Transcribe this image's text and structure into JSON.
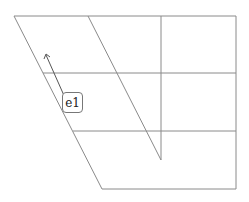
{
  "diagram": {
    "type": "skewed-grid",
    "stroke_color": "#888888",
    "label": {
      "text": "e1"
    },
    "arrow": {
      "direction": "up-left"
    }
  }
}
